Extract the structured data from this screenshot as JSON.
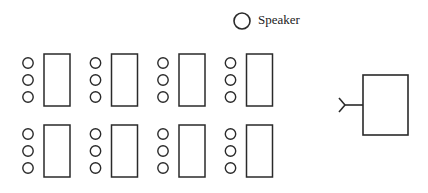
{
  "diagram": {
    "speaker": {
      "label": "Speaker",
      "icon": "circle"
    },
    "rows": [
      {
        "name": "front-row",
        "groups": [
          {
            "seats": 3
          },
          {
            "seats": 3
          },
          {
            "seats": 3
          },
          {
            "seats": 3
          }
        ]
      },
      {
        "name": "back-row",
        "groups": [
          {
            "seats": 3
          },
          {
            "seats": 3
          },
          {
            "seats": 3
          },
          {
            "seats": 3
          }
        ]
      }
    ],
    "podium": {
      "shape": "rectangle",
      "has_microphone": true
    },
    "colors": {
      "stroke": "#2a2a2a",
      "background": "#ffffff"
    }
  }
}
